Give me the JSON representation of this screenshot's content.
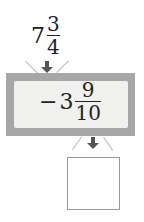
{
  "input": {
    "sign": "",
    "whole": "7",
    "numerator": "3",
    "denominator": "4"
  },
  "operation": {
    "sign": "−",
    "whole": "3",
    "numerator": "9",
    "denominator": "10"
  },
  "output": {
    "value": ""
  },
  "colors": {
    "machine_frame": "#a7a7a7",
    "machine_inner": "#f0f0ee",
    "arrow": "#555555"
  }
}
